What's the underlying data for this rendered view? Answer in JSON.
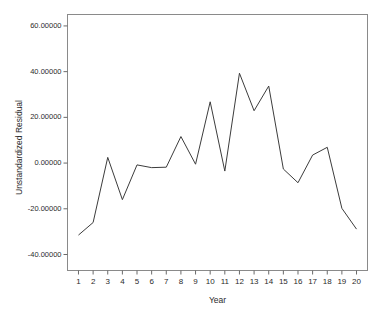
{
  "chart_data": {
    "type": "line",
    "title": "",
    "xlabel": "Year",
    "ylabel": "Unstandardized Residual",
    "x": [
      1,
      2,
      3,
      4,
      5,
      6,
      7,
      8,
      9,
      10,
      11,
      12,
      13,
      14,
      15,
      16,
      17,
      18,
      19,
      20
    ],
    "values": [
      -31.5,
      -26.0,
      2.5,
      -16.0,
      -0.8,
      -2.0,
      -1.8,
      11.6,
      -0.5,
      26.8,
      -3.5,
      39.3,
      22.9,
      33.7,
      -2.6,
      -8.6,
      3.5,
      6.9,
      -19.8,
      -28.9
    ],
    "series": [
      {
        "name": "Unstandardized Residual",
        "values": [
          -31.5,
          -26.0,
          2.5,
          -16.0,
          -0.8,
          -2.0,
          -1.8,
          11.6,
          -0.5,
          26.8,
          -3.5,
          39.3,
          22.9,
          33.7,
          -2.6,
          -8.6,
          3.5,
          6.9,
          -19.8,
          -28.9
        ]
      }
    ],
    "xtick_labels": [
      "1",
      "2",
      "3",
      "4",
      "5",
      "6",
      "7",
      "8",
      "9",
      "10",
      "11",
      "12",
      "13",
      "14",
      "15",
      "16",
      "17",
      "18",
      "19",
      "20"
    ],
    "ytick_labels": [
      "60.00000",
      "40.00000",
      "20.00000",
      "0.00000",
      "-20.00000",
      "-40.00000"
    ],
    "ytick_values": [
      60,
      40,
      20,
      0,
      -20,
      -40
    ],
    "ylim": [
      -47,
      65
    ],
    "xlim": [
      0.25,
      20.75
    ],
    "grid": false,
    "legend": null,
    "line_color": "#3c3c3c",
    "frame_color": "#8a8a8a",
    "background": "#ffffff"
  }
}
